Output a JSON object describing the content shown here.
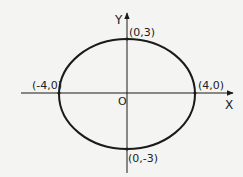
{
  "diagram": {
    "type": "ellipse",
    "equation_params": {
      "a": 4,
      "b": 3
    },
    "axes": {
      "x_label": "X",
      "y_label": "Y",
      "origin_label": "O"
    },
    "points": [
      {
        "name": "top-vertex",
        "label": "(0,3)"
      },
      {
        "name": "bottom-vertex",
        "label": "(0,-3)"
      },
      {
        "name": "left-vertex",
        "label": "(-4,0)"
      },
      {
        "name": "right-vertex",
        "label": "(4,0)"
      }
    ],
    "colors": {
      "stroke": "#1a1a1a",
      "background": "#f4f4f2"
    }
  }
}
